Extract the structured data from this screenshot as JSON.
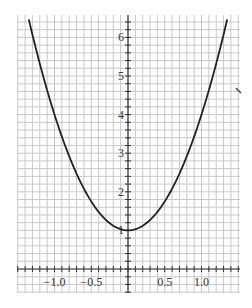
{
  "chart_data": {
    "type": "line",
    "title": "",
    "xlabel": "",
    "ylabel": "",
    "function": "y = 1 + 3x^2",
    "xlim": [
      -1.52,
      1.52
    ],
    "ylim": [
      -0.6,
      6.5
    ],
    "grid": true,
    "grid_minor_x": 0.1,
    "grid_minor_y": 0.2,
    "x_ticks": [
      -1.0,
      -0.5,
      0.5,
      1.0
    ],
    "x_tick_labels": [
      "−1.0",
      "−0.5",
      "0.5",
      "1.0"
    ],
    "y_ticks": [
      1,
      2,
      3,
      4,
      5,
      6
    ],
    "y_tick_labels": [
      "1",
      "2",
      "3",
      "4",
      "5",
      "6"
    ],
    "series": [
      {
        "name": "curve",
        "x": [
          -1.35,
          -1.2,
          -1.0,
          -0.8,
          -0.6,
          -0.4,
          -0.2,
          0.0,
          0.2,
          0.4,
          0.6,
          0.8,
          1.0,
          1.2,
          1.35
        ],
        "y": [
          6.47,
          5.32,
          4.0,
          2.92,
          2.08,
          1.48,
          1.12,
          1.0,
          1.12,
          1.48,
          2.08,
          2.92,
          4.0,
          5.32,
          6.47
        ]
      }
    ],
    "colors": {
      "grid": "#c8c8c8",
      "axis": "#333333",
      "curve": "#222222"
    }
  }
}
